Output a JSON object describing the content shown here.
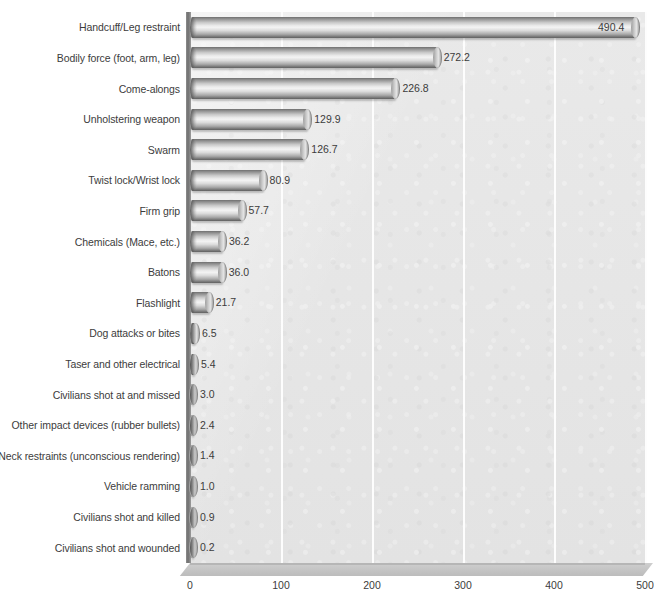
{
  "chart_data": {
    "type": "bar",
    "orientation": "horizontal",
    "title": "",
    "subtitle": "",
    "xlabel": "",
    "ylabel": "",
    "xlim": [
      0,
      500
    ],
    "ylim": null,
    "grid": true,
    "gridlines": "vertical-white",
    "legend": null,
    "legend_position": "none",
    "xticks": [
      "0",
      "100",
      "200",
      "300",
      "400",
      "500"
    ],
    "xtick_values": [
      0,
      100,
      200,
      300,
      400,
      500
    ],
    "categories": [
      "Handcuff/Leg restraint",
      "Bodily force (foot, arm, leg)",
      "Come-alongs",
      "Unholstering weapon",
      "Swarm",
      "Twist lock/Wrist lock",
      "Firm grip",
      "Chemicals (Mace, etc.)",
      "Batons",
      "Flashlight",
      "Dog attacks or bites",
      "Taser and other electrical",
      "Civilians shot at and missed",
      "Other impact devices (rubber bullets)",
      "Neck restraints (unconscious rendering)",
      "Vehicle ramming",
      "Civilians shot and killed",
      "Civilians shot and wounded"
    ],
    "values": [
      490.4,
      272.2,
      226.8,
      129.9,
      126.7,
      80.9,
      57.7,
      36.2,
      36.0,
      21.7,
      6.5,
      5.4,
      3.0,
      2.4,
      1.4,
      1.0,
      0.9,
      0.2
    ],
    "value_labels": [
      "490.4",
      "272.2",
      "226.8",
      "129.9",
      "126.7",
      "80.9",
      "57.7",
      "36.2",
      "36.0",
      "21.7",
      "6.5",
      "5.4",
      "3.0",
      "2.4",
      "1.4",
      "1.0",
      "0.9",
      "0.2"
    ],
    "label_placement": [
      "inside",
      "outside",
      "outside",
      "outside",
      "outside",
      "outside",
      "outside",
      "outside",
      "outside",
      "outside",
      "outside",
      "outside",
      "outside",
      "outside",
      "outside",
      "outside",
      "outside",
      "outside"
    ],
    "style": {
      "bar_style": "3d-cylinder",
      "plot_background": "#e6e6e6",
      "gridline_color": "#fdfdfd",
      "bar_color_light": "#f2f2f2",
      "bar_color_dark": "#5f5f5f",
      "text_color": "#3c3c3c",
      "page_background": "#ffffff"
    }
  }
}
